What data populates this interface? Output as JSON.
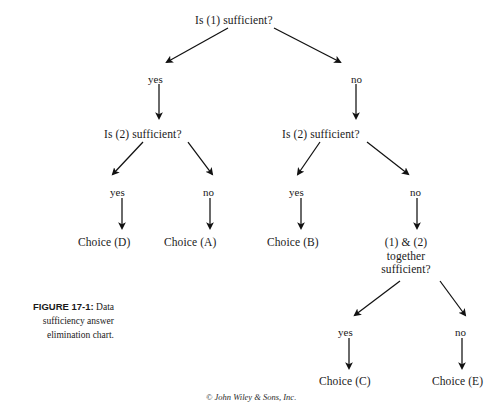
{
  "figure": {
    "caption_title": "FIGURE 17-1:",
    "caption_text": "Data sufficiency answer elimination chart.",
    "copyright": "© John Wiley & Sons, Inc."
  },
  "diagram": {
    "type": "decision-tree",
    "nodes": [
      {
        "id": "root",
        "label": "Is (1) sufficient?",
        "x": 249,
        "y": 14
      },
      {
        "id": "left1",
        "label": "Is (2) sufficient?",
        "x": 160,
        "y": 128
      },
      {
        "id": "right1",
        "label": "Is (2) sufficient?",
        "x": 338,
        "y": 128
      },
      {
        "id": "choice-d",
        "label": "Choice (D)",
        "x": 108,
        "y": 236
      },
      {
        "id": "choice-a",
        "label": "Choice (A)",
        "x": 194,
        "y": 236
      },
      {
        "id": "choice-b",
        "label": "Choice (B)",
        "x": 297,
        "y": 236
      },
      {
        "id": "together",
        "label": "(1) & (2)\ntogether\nsufficient?",
        "x": 406,
        "y": 236
      },
      {
        "id": "choice-c",
        "label": "Choice (C)",
        "x": 369,
        "y": 375
      },
      {
        "id": "choice-e",
        "label": "Choice (E)",
        "x": 446,
        "y": 375
      }
    ],
    "edges": [
      {
        "from": "root",
        "to": "left1",
        "label": "yes"
      },
      {
        "from": "root",
        "to": "right1",
        "label": "no"
      },
      {
        "from": "left1",
        "to": "choice-d",
        "label": "yes"
      },
      {
        "from": "left1",
        "to": "choice-a",
        "label": "no"
      },
      {
        "from": "right1",
        "to": "choice-b",
        "label": "yes"
      },
      {
        "from": "right1",
        "to": "together",
        "label": "no"
      },
      {
        "from": "together",
        "to": "choice-c",
        "label": "yes"
      },
      {
        "from": "together",
        "to": "choice-e",
        "label": "no"
      }
    ],
    "edge_labels": [
      {
        "id": "lbl-yes-1",
        "text": "yes",
        "x": 148,
        "y": 73
      },
      {
        "id": "lbl-no-1",
        "text": "no",
        "x": 351,
        "y": 73
      },
      {
        "id": "lbl-yes-2",
        "text": "yes",
        "x": 114,
        "y": 186
      },
      {
        "id": "lbl-no-2",
        "text": "no",
        "x": 205,
        "y": 186
      },
      {
        "id": "lbl-yes-3",
        "text": "yes",
        "x": 292,
        "y": 186
      },
      {
        "id": "lbl-no-3",
        "text": "no",
        "x": 407,
        "y": 186
      },
      {
        "id": "lbl-yes-4",
        "text": "yes",
        "x": 341,
        "y": 326
      },
      {
        "id": "lbl-no-4",
        "text": "no",
        "x": 455,
        "y": 326
      }
    ]
  },
  "colors": {
    "ink": "#1a1a1a",
    "background": "#ffffff",
    "arrow": "#111111"
  }
}
